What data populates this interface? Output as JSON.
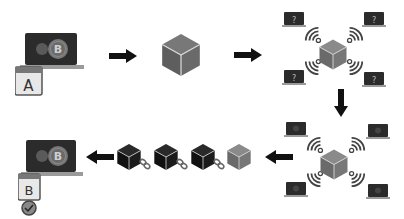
{
  "diagram": {
    "colors": {
      "laptop_screen": "#2b2b2b",
      "laptop_base": "#8a8a8a",
      "coin": "#6e6e6e",
      "cube_gray": "#6a6a6a",
      "cube_dark": "#1c1c1c",
      "arrow": "#111111",
      "tag": "#bdbdbd"
    },
    "steps": [
      {
        "id": "sender",
        "tag_label": "A",
        "coin_symbol": "B"
      },
      {
        "id": "transaction-block"
      },
      {
        "id": "broadcast-network",
        "node_glyph": "?"
      },
      {
        "id": "validation-network"
      },
      {
        "id": "blockchain",
        "block_count": 4
      },
      {
        "id": "receiver",
        "tag_label": "B",
        "coin_symbol": "B",
        "status": "verified"
      }
    ]
  }
}
